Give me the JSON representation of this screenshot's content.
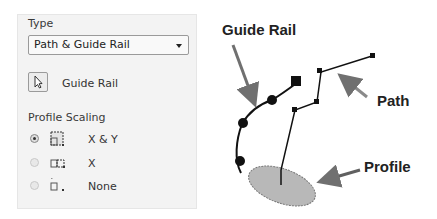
{
  "panel": {
    "type_label": "Type",
    "type_dropdown": {
      "selected": "Path & Guide Rail"
    },
    "pick_button": {
      "icon": "cursor-arrow-icon",
      "label": "Guide Rail"
    },
    "profile_scaling": {
      "label": "Profile Scaling",
      "options": [
        {
          "label": "X & Y",
          "icon": "scale-xy-icon",
          "checked": true
        },
        {
          "label": "X",
          "icon": "scale-x-icon",
          "checked": false
        },
        {
          "label": "None",
          "icon": "scale-none-icon",
          "checked": false
        }
      ]
    }
  },
  "diagram": {
    "callouts": {
      "guide_rail": "Guide Rail",
      "path": "Path",
      "profile": "Profile"
    },
    "colors": {
      "arrow": "#707070",
      "profile_fill": "#b8b8b8",
      "curve": "#111111"
    }
  }
}
